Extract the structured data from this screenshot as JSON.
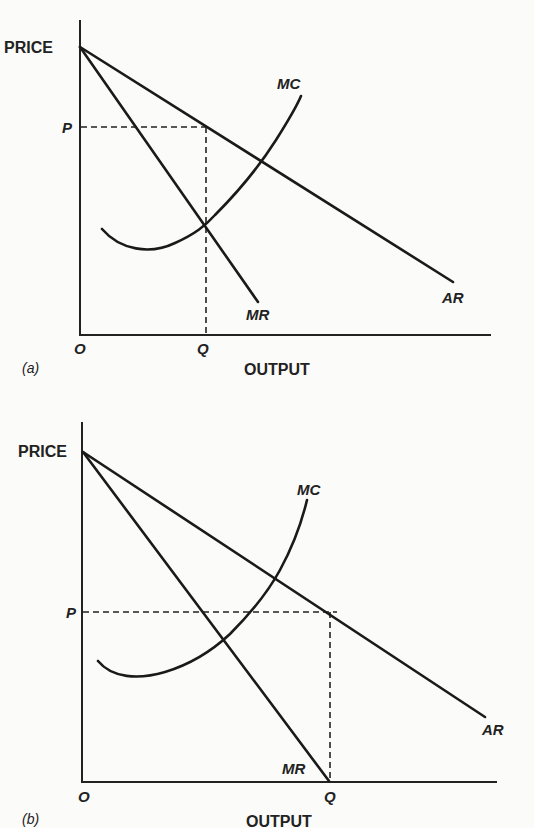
{
  "figure": {
    "panels": [
      {
        "id": "a",
        "caption": "(a)",
        "y_axis_label": "PRICE",
        "x_axis_label": "OUTPUT",
        "origin_label": "O",
        "price_label": "P",
        "quantity_label": "Q",
        "curves": {
          "mc": "MC",
          "mr": "MR",
          "ar": "AR"
        },
        "description": "Profit-maximizing output Q where MR = MC; price P read from AR curve"
      },
      {
        "id": "b",
        "caption": "(b)",
        "y_axis_label": "PRICE",
        "x_axis_label": "OUTPUT",
        "origin_label": "O",
        "price_label": "P",
        "quantity_label": "Q",
        "curves": {
          "mc": "MC",
          "mr": "MR",
          "ar": "AR"
        },
        "description": "Revenue-maximizing output Q where MR = 0; price P read from AR curve"
      }
    ],
    "colors": {
      "ink": "#1a1a1a",
      "paper": "#fbfbf9"
    }
  }
}
